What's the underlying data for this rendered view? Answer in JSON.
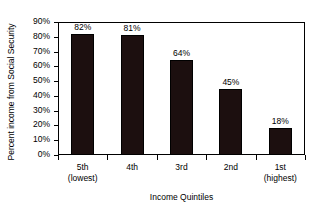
{
  "chart_data": {
    "type": "bar",
    "title": "",
    "xlabel": "Income Quintiles",
    "ylabel": "Percent income from Social Security",
    "categories": [
      "5th",
      "4th",
      "3rd",
      "2nd",
      "1st"
    ],
    "category_sublabels": [
      "(lowest)",
      "",
      "",
      "",
      "(highest)"
    ],
    "values": [
      82,
      81,
      64,
      45,
      18
    ],
    "value_labels": [
      "82%",
      "81%",
      "64%",
      "45%",
      "18%"
    ],
    "ylim": [
      0,
      90
    ],
    "ytick_labels": [
      "90%",
      "80%",
      "70%",
      "60%",
      "50%",
      "40%",
      "30%",
      "20%",
      "10%",
      "0%"
    ],
    "ytick_values": [
      90,
      80,
      70,
      60,
      50,
      40,
      30,
      20,
      10,
      0
    ],
    "grid": false,
    "legend": null,
    "bar_color": "#1c0f0f",
    "axis_color": "#000000",
    "background_color": "#ffffff"
  }
}
